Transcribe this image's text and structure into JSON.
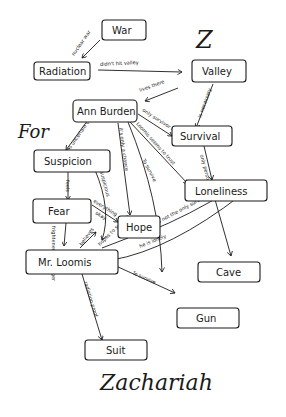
{
  "diagram": {
    "type": "concept-map",
    "style": "hand-drawn",
    "colors": {
      "ink": "#1a1a1a",
      "paper": "#ffffff"
    },
    "headings": {
      "top_letter": "Z",
      "for_word": "For",
      "title": "Zachariah"
    },
    "nodes": {
      "war": "War",
      "radiation": "Radiation",
      "valley": "Valley",
      "ann_burden": "Ann Burden",
      "survival": "Survival",
      "suspicion": "Suspicion",
      "loneliness": "Loneliness",
      "fear": "Fear",
      "hope": "Hope",
      "mr_loomis": "Mr. Loomis",
      "cave": "Cave",
      "gun": "Gun",
      "suit": "Suit"
    },
    "edges": {
      "war_radiation": "nuclear war",
      "radiation_valley": "didn't hit valley",
      "valley_ann": "lives there",
      "valley_survival": "is necessary",
      "ann_survival": "only survivor in valley",
      "ann_suspicion": "is uncertain of",
      "ann_hope": "it's only a chance",
      "ann_loneliness": "Loomis seems to trust",
      "ann_gun": "To survive",
      "survival_loneliness": "only person left",
      "suspicion_fear": "feels",
      "suspicion_loomis": "suspicious",
      "fear_hope": "everything",
      "fear_hope_2": "okay",
      "fear_loomis": "frightened of stranger",
      "loomis_hope": "believes",
      "loomis_hope_2": "hopes to survive",
      "loneliness_hope": "she's not the only survivor",
      "loneliness_cave": "",
      "loomis_loneliness": "he is lonely",
      "loomis_gun": "To survive",
      "loomis_suit": "radiation proof"
    }
  }
}
